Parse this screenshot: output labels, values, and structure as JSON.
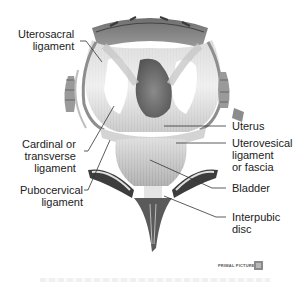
{
  "figure": {
    "colors": {
      "tissue_light": "#e6e6e6",
      "tissue_mid": "#a9a9a9",
      "tissue_dark": "#555555",
      "uterus": "#6e6e6e",
      "leader_line": "#333333"
    }
  },
  "labels": {
    "uterosacral": "Uterosacral\nligament",
    "cardinal": "Cardinal or\ntransverse\nligament",
    "pubocervical": "Pubocervical\nligament",
    "uterus": "Uterus",
    "uterovesical": "Uterovesical\nligament\nor fascia",
    "bladder": "Bladder",
    "interpubic": "Interpubic\ndisc"
  },
  "footer": {
    "brand": "PRIMAL PICTURES"
  }
}
